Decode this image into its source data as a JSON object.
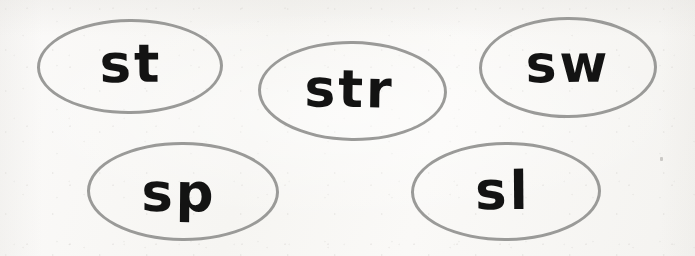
{
  "page": {
    "background_color": "#f8f7f5",
    "outline_color": "#9a9a98",
    "text_color": "#131313"
  },
  "worksheet": {
    "ovals": [
      {
        "id": "st",
        "label": "st",
        "row": "top",
        "position": "left"
      },
      {
        "id": "str",
        "label": "str",
        "row": "top",
        "position": "center"
      },
      {
        "id": "sw",
        "label": "sw",
        "row": "top",
        "position": "right"
      },
      {
        "id": "sp",
        "label": "sp",
        "row": "bottom",
        "position": "left"
      },
      {
        "id": "sl",
        "label": "sl",
        "row": "bottom",
        "position": "right"
      }
    ]
  }
}
